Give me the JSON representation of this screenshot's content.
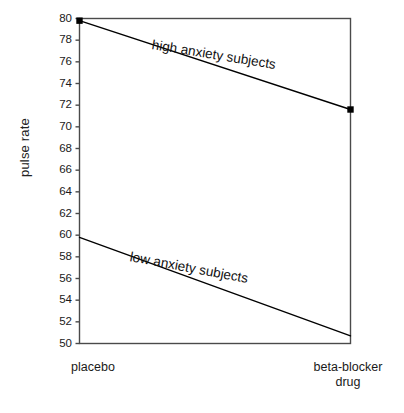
{
  "chart_data": {
    "type": "line",
    "title": "",
    "xlabel": "",
    "ylabel": "pulse rate",
    "categories": [
      "placebo",
      "beta-blocker\ndrug"
    ],
    "x": [
      0,
      1
    ],
    "ylim": [
      50,
      80
    ],
    "yticks": [
      50,
      52,
      54,
      56,
      58,
      60,
      62,
      64,
      66,
      68,
      70,
      72,
      74,
      76,
      78,
      80
    ],
    "ytick_labels": [
      "50",
      "52",
      "54",
      "56",
      "58",
      "60",
      "62",
      "64",
      "66",
      "68",
      "70",
      "72",
      "74",
      "76",
      "78",
      "80"
    ],
    "grid": false,
    "legend_position": "inline-annotation",
    "series": [
      {
        "name": "high anxiety subjects",
        "values": [
          79.8,
          71.6
        ],
        "markers": true,
        "marker_shape": "square",
        "color": "#000000"
      },
      {
        "name": "low anxiety subjects",
        "values": [
          59.8,
          50.7
        ],
        "markers": false,
        "marker_shape": "none",
        "color": "#000000"
      }
    ],
    "annotations": [
      {
        "text": "high anxiety subjects",
        "x": 0.45,
        "y": 76.0,
        "rotation": -9.2
      },
      {
        "text": "low anxiety subjects",
        "x": 0.4,
        "y": 56.6,
        "rotation": -10.6
      }
    ]
  },
  "axis": {
    "y_title": "pulse rate",
    "x_labels": {
      "left": "placebo",
      "right": "beta-blocker\ndrug"
    }
  },
  "colors": {
    "line": "#000000",
    "frame": "#4a4a4a",
    "text": "#1a1a1a",
    "background": "#ffffff"
  },
  "fragments": {
    "top": ".",
    "bottom": ""
  }
}
